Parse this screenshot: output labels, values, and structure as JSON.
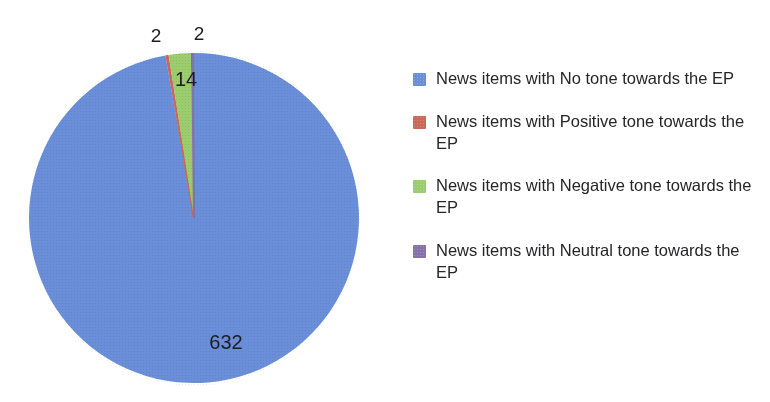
{
  "chart_data": {
    "type": "pie",
    "title": "",
    "subtitle": "",
    "xlabel": "",
    "ylabel": "",
    "grid": false,
    "legend_position": "right",
    "total": 650,
    "categories": [
      "News items with No tone towards the EP",
      "News items with Positive tone towards the EP",
      "News items with Negative tone towards the EP",
      "News items with Neutral tone towards the EP"
    ],
    "values": [
      632,
      2,
      14,
      2
    ],
    "colors": [
      "#6A8FD8",
      "#C9695A",
      "#9BCC6E",
      "#8572AD"
    ],
    "slices": [
      {
        "label": "News items with No tone towards the EP",
        "value": 632,
        "value_text": "632",
        "color": "#6A8FD8",
        "percent": 97.2,
        "label_placement": "inside"
      },
      {
        "label": "News items with Positive tone towards the EP",
        "value": 2,
        "value_text": "2",
        "color": "#C9695A",
        "percent": 0.3,
        "label_placement": "outside"
      },
      {
        "label": "News items with Negative tone towards the EP",
        "value": 14,
        "value_text": "14",
        "color": "#9BCC6E",
        "percent": 2.2,
        "label_placement": "inside"
      },
      {
        "label": "News items with Neutral tone towards the EP",
        "value": 2,
        "value_text": "2",
        "color": "#8572AD",
        "percent": 0.3,
        "label_placement": "outside"
      }
    ]
  },
  "pie": {
    "data_labels": {
      "no_tone": "632",
      "positive": "2",
      "negative": "14",
      "neutral": "2"
    }
  },
  "legend": {
    "items": [
      {
        "label": "News items with No tone towards the EP",
        "color": "#6A8FD8",
        "swatch_name": "legend-swatch-no-tone"
      },
      {
        "label": "News items with Positive tone towards the EP",
        "color": "#C9695A",
        "swatch_name": "legend-swatch-positive-tone"
      },
      {
        "label": "News items with Negative tone towards the EP",
        "color": "#9BCC6E",
        "swatch_name": "legend-swatch-negative-tone"
      },
      {
        "label": "News items with Neutral tone towards the EP",
        "color": "#8572AD",
        "swatch_name": "legend-swatch-neutral-tone"
      }
    ]
  }
}
